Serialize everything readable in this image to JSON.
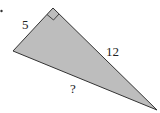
{
  "diagram": {
    "type": "right-triangle",
    "fill_color": "#bdbdbd",
    "stroke_color": "#333333",
    "vertices": {
      "top": [
        53,
        8
      ],
      "left": [
        13,
        51
      ],
      "right": [
        157,
        110
      ]
    },
    "right_angle_at": "top",
    "labels": {
      "short_leg": "5",
      "long_leg": "12",
      "hypotenuse": "?"
    }
  }
}
